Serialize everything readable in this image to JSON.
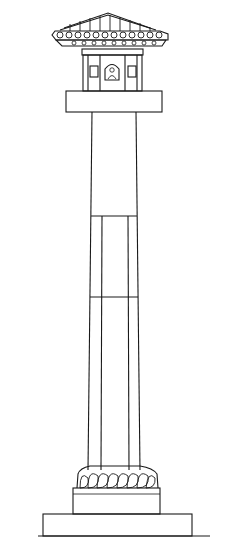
{
  "figure": {
    "stroke_color": "#1a1a1a",
    "background_color": "#ffffff",
    "parts": [
      {
        "name": "pediment-roof"
      },
      {
        "name": "shrine-pavilion",
        "niches": 3
      },
      {
        "name": "abacus-slab"
      },
      {
        "name": "upper-shaft-segment"
      },
      {
        "name": "middle-shaft-segment"
      },
      {
        "name": "lower-shaft-segment"
      },
      {
        "name": "lotus-base"
      },
      {
        "name": "plinth"
      },
      {
        "name": "ground-base"
      }
    ]
  }
}
